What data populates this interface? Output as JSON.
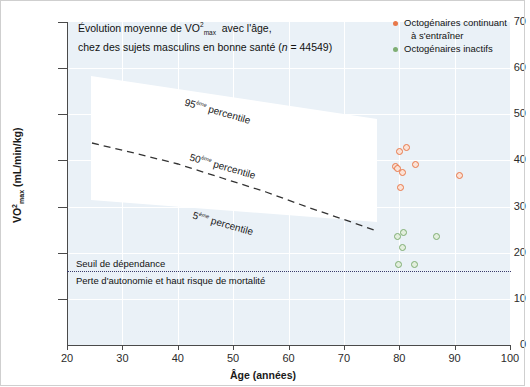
{
  "chart_data": {
    "type": "scatter",
    "title_line1": "Évolution moyenne de VO²max  avec l'âge,",
    "title_line2_a": "chez des sujets masculins en bonne santé (",
    "title_line2_n": "n",
    "title_line2_b": " = 44549)",
    "xlabel": "Âge (années)",
    "ylabel": "VO²max (mL/min/kg)",
    "ylabel_main": "VO",
    "ylabel_sup": "2",
    "ylabel_sub": "max",
    "ylabel_units": " (mL/min/kg)",
    "xlim": [
      20,
      100
    ],
    "ylim": [
      0,
      70
    ],
    "xticks": [
      20,
      30,
      40,
      50,
      60,
      70,
      80,
      90,
      100
    ],
    "yticks": [
      0,
      10,
      20,
      30,
      40,
      50,
      60,
      70
    ],
    "grid": true,
    "legend_position": "top-right",
    "series": [
      {
        "name": "Octogénaires continuant à s'entraîner",
        "name_line1": "Octogénaires continuant",
        "name_line2": "à s'entraîner",
        "color": "#e8784a",
        "points": [
          {
            "x": 80.0,
            "y": 42.0
          },
          {
            "x": 81.3,
            "y": 42.8
          },
          {
            "x": 79.3,
            "y": 38.6
          },
          {
            "x": 79.6,
            "y": 38.2
          },
          {
            "x": 80.6,
            "y": 37.4
          },
          {
            "x": 83.0,
            "y": 39.2
          },
          {
            "x": 80.2,
            "y": 34.2
          },
          {
            "x": 90.8,
            "y": 36.8
          }
        ]
      },
      {
        "name": "Octogénaires inactifs",
        "name_line1": "Octogénaires inactifs",
        "color": "#7fae73",
        "points": [
          {
            "x": 79.7,
            "y": 23.6
          },
          {
            "x": 80.8,
            "y": 24.3
          },
          {
            "x": 86.7,
            "y": 23.6
          },
          {
            "x": 80.6,
            "y": 21.2
          },
          {
            "x": 79.8,
            "y": 17.4
          },
          {
            "x": 82.8,
            "y": 17.4
          }
        ]
      }
    ],
    "percentile_bands": [
      {
        "label_main": "95",
        "label_sup": "ème",
        "label_rest": " percentile"
      },
      {
        "label_main": "50",
        "label_sup": "ème",
        "label_rest": " percentile"
      },
      {
        "label_main": "5",
        "label_sup": "ème",
        "label_rest": " percentile"
      }
    ],
    "median_curve": {
      "description": "50ème percentile dashed trend line",
      "points": [
        {
          "x": 24.5,
          "y": 43.8
        },
        {
          "x": 40.0,
          "y": 41.3
        },
        {
          "x": 55.0,
          "y": 37.8
        },
        {
          "x": 65.0,
          "y": 34.8
        },
        {
          "x": 75.0,
          "y": 30.3
        }
      ]
    },
    "threshold": {
      "value": 16,
      "label_above": "Seuil de dépendance",
      "label_below": "Perte d'autonomie et haut risque de mortalité",
      "color": "#3b3b6b"
    },
    "colors": {
      "plot_background": "#eaf1f7",
      "band_fill": "#ffffff",
      "axis": "#4a4a4a",
      "orange": "#e8784a",
      "green": "#7fae73"
    }
  }
}
